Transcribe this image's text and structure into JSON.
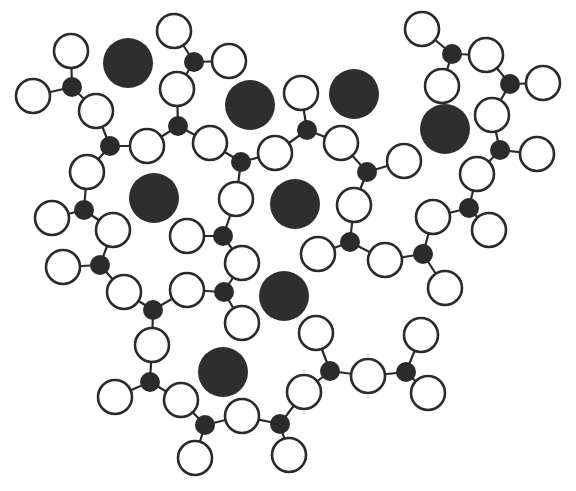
{
  "diagram": {
    "colors": {
      "background": "#ffffff",
      "line": "#2a2a2a",
      "dark_node": "#2b2b2b",
      "cation": "#2e2e2e",
      "open_fill": "#ffffff"
    },
    "radii": {
      "cation": 25,
      "center": 10,
      "open": 17
    },
    "cations": [
      [
        128,
        63
      ],
      [
        250,
        105
      ],
      [
        354,
        94
      ],
      [
        445,
        129
      ],
      [
        154,
        198
      ],
      [
        295,
        204
      ],
      [
        284,
        296
      ],
      [
        223,
        372
      ]
    ],
    "centers": {
      "A": [
        72,
        87
      ],
      "B": [
        110,
        146
      ],
      "C": [
        194,
        62
      ],
      "D": [
        178,
        126
      ],
      "E": [
        241,
        162
      ],
      "F": [
        307,
        130
      ],
      "G": [
        84,
        210
      ],
      "H": [
        367,
        172
      ],
      "I": [
        100,
        265
      ],
      "J": [
        223,
        236
      ],
      "K": [
        224,
        292
      ],
      "L": [
        153,
        310
      ],
      "M": [
        150,
        382
      ],
      "N": [
        205,
        425
      ],
      "O": [
        280,
        424
      ],
      "P": [
        330,
        371
      ],
      "Q": [
        406,
        372
      ],
      "R": [
        452,
        54
      ],
      "S": [
        510,
        84
      ],
      "T": [
        500,
        150
      ],
      "U": [
        469,
        208
      ],
      "V": [
        423,
        254
      ],
      "W": [
        350,
        242
      ]
    },
    "open_atoms": [
      {
        "pos": [
          71,
          51
        ],
        "bonds": [
          "A"
        ]
      },
      {
        "pos": [
          33,
          96
        ],
        "bonds": [
          "A"
        ]
      },
      {
        "pos": [
          96,
          111
        ],
        "bonds": [
          "A",
          "B"
        ]
      },
      {
        "pos": [
          147,
          146
        ],
        "bonds": [
          "B",
          "D"
        ]
      },
      {
        "pos": [
          87,
          172
        ],
        "bonds": [
          "B",
          "G"
        ]
      },
      {
        "pos": [
          174,
          31
        ],
        "bonds": [
          "C"
        ]
      },
      {
        "pos": [
          229,
          61
        ],
        "bonds": [
          "C"
        ]
      },
      {
        "pos": [
          177,
          89
        ],
        "bonds": [
          "C",
          "D"
        ]
      },
      {
        "pos": [
          210,
          143
        ],
        "bonds": [
          "D",
          "E"
        ]
      },
      {
        "pos": [
          275,
          153
        ],
        "bonds": [
          "E",
          "F"
        ]
      },
      {
        "pos": [
          236,
          199
        ],
        "bonds": [
          "E",
          "J"
        ]
      },
      {
        "pos": [
          301,
          93
        ],
        "bonds": [
          "F"
        ]
      },
      {
        "pos": [
          341,
          143
        ],
        "bonds": [
          "F",
          "H"
        ]
      },
      {
        "pos": [
          404,
          161
        ],
        "bonds": [
          "H"
        ]
      },
      {
        "pos": [
          354,
          205
        ],
        "bonds": [
          "H",
          "W"
        ]
      },
      {
        "pos": [
          52,
          218
        ],
        "bonds": [
          "G"
        ]
      },
      {
        "pos": [
          113,
          230
        ],
        "bonds": [
          "G",
          "I"
        ]
      },
      {
        "pos": [
          63,
          267
        ],
        "bonds": [
          "I"
        ]
      },
      {
        "pos": [
          124,
          292
        ],
        "bonds": [
          "I",
          "L"
        ]
      },
      {
        "pos": [
          187,
          236
        ],
        "bonds": [
          "J"
        ]
      },
      {
        "pos": [
          242,
          263
        ],
        "bonds": [
          "J",
          "K"
        ]
      },
      {
        "pos": [
          187,
          290
        ],
        "bonds": [
          "K",
          "L"
        ]
      },
      {
        "pos": [
          242,
          323
        ],
        "bonds": [
          "K"
        ]
      },
      {
        "pos": [
          152,
          345
        ],
        "bonds": [
          "L",
          "M"
        ]
      },
      {
        "pos": [
          115,
          397
        ],
        "bonds": [
          "M"
        ]
      },
      {
        "pos": [
          181,
          400
        ],
        "bonds": [
          "M",
          "N"
        ]
      },
      {
        "pos": [
          195,
          458
        ],
        "bonds": [
          "N"
        ]
      },
      {
        "pos": [
          242,
          416
        ],
        "bonds": [
          "N",
          "O"
        ]
      },
      {
        "pos": [
          289,
          455
        ],
        "bonds": [
          "O"
        ]
      },
      {
        "pos": [
          304,
          392
        ],
        "bonds": [
          "O",
          "P"
        ]
      },
      {
        "pos": [
          316,
          333
        ],
        "bonds": [
          "P"
        ]
      },
      {
        "pos": [
          368,
          376
        ],
        "bonds": [
          "P",
          "Q"
        ]
      },
      {
        "pos": [
          421,
          335
        ],
        "bonds": [
          "Q"
        ]
      },
      {
        "pos": [
          428,
          393
        ],
        "bonds": [
          "Q"
        ]
      },
      {
        "pos": [
          318,
          254
        ],
        "bonds": [
          "W"
        ]
      },
      {
        "pos": [
          385,
          260
        ],
        "bonds": [
          "W",
          "V"
        ]
      },
      {
        "pos": [
          445,
          288
        ],
        "bonds": [
          "V"
        ]
      },
      {
        "pos": [
          433,
          217
        ],
        "bonds": [
          "V",
          "U"
        ]
      },
      {
        "pos": [
          489,
          230
        ],
        "bonds": [
          "U"
        ]
      },
      {
        "pos": [
          477,
          174
        ],
        "bonds": [
          "U",
          "T"
        ]
      },
      {
        "pos": [
          537,
          154
        ],
        "bonds": [
          "T"
        ]
      },
      {
        "pos": [
          492,
          115
        ],
        "bonds": [
          "T",
          "S"
        ]
      },
      {
        "pos": [
          543,
          83
        ],
        "bonds": [
          "S"
        ]
      },
      {
        "pos": [
          486,
          55
        ],
        "bonds": [
          "S",
          "R"
        ]
      },
      {
        "pos": [
          422,
          29
        ],
        "bonds": [
          "R"
        ]
      },
      {
        "pos": [
          442,
          86
        ],
        "bonds": [
          "R"
        ]
      }
    ]
  }
}
